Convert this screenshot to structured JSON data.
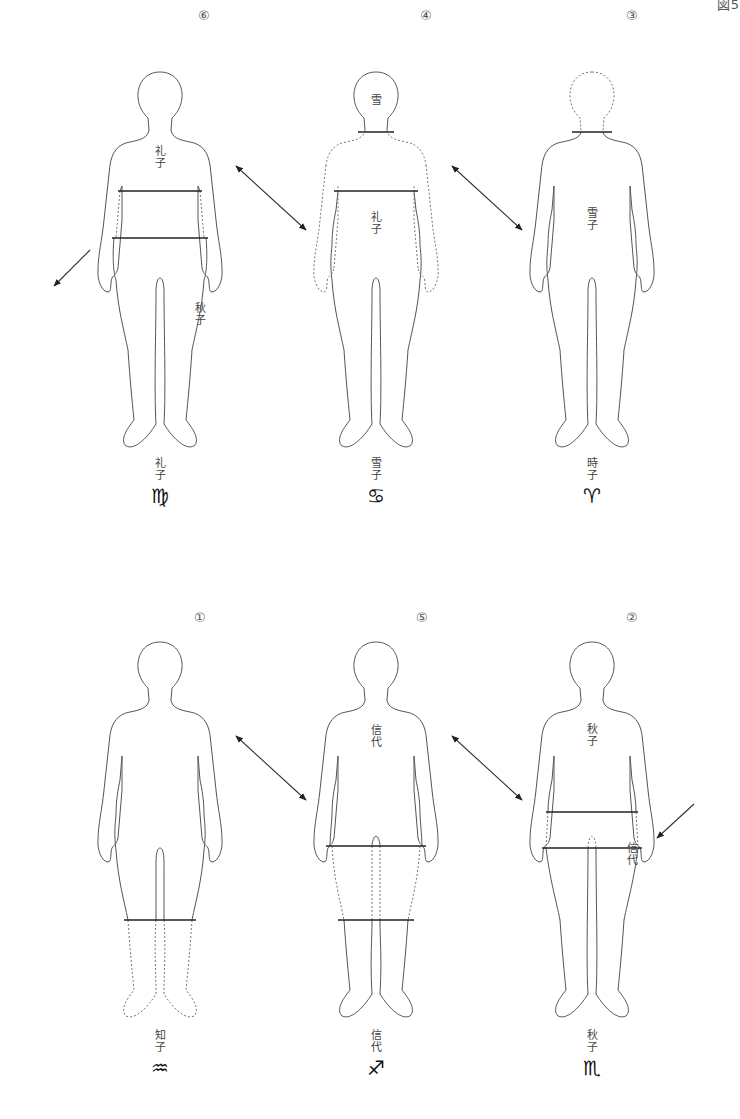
{
  "page": {
    "corner_label": "図5"
  },
  "figures": [
    {
      "id": "virgo",
      "number": "⑥",
      "name": "礼子",
      "glyph": "♍",
      "inner_labels": [
        {
          "text": "礼子",
          "pos": "chest"
        },
        {
          "text": "秋子",
          "pos": "right-leg"
        }
      ],
      "segment": "torso-lower",
      "dashed_parts": [
        "waist-sides"
      ]
    },
    {
      "id": "cancer",
      "number": "④",
      "name": "雪子",
      "glyph": "♋",
      "inner_labels": [
        {
          "text": "雪",
          "pos": "head"
        },
        {
          "text": "礼子",
          "pos": "belly"
        }
      ],
      "segment": "neck-and-waist",
      "dashed_parts": [
        "shoulders",
        "arms"
      ]
    },
    {
      "id": "aries",
      "number": "③",
      "name": "時子",
      "glyph": "♈",
      "inner_labels": [
        {
          "text": "雪子",
          "pos": "belly"
        }
      ],
      "segment": "neck",
      "dashed_parts": [
        "head"
      ]
    },
    {
      "id": "aquarius",
      "number": "①",
      "name": "知子",
      "glyph": "♒",
      "inner_labels": [],
      "segment": "knee",
      "dashed_parts": [
        "lower-legs"
      ]
    },
    {
      "id": "sagittarius",
      "number": "⑤",
      "name": "信代",
      "glyph": "♐",
      "inner_labels": [
        {
          "text": "信代",
          "pos": "chest"
        }
      ],
      "segment": "hip-and-knee",
      "dashed_parts": [
        "thighs"
      ]
    },
    {
      "id": "scorpio",
      "number": "②",
      "name": "秋子",
      "glyph": "♏",
      "inner_labels": [
        {
          "text": "秋子",
          "pos": "chest"
        },
        {
          "text": "信代",
          "pos": "right-leg"
        }
      ],
      "segment": "hip",
      "dashed_parts": [
        "hip-sides"
      ]
    }
  ],
  "arrows": [
    {
      "from": "virgo",
      "to": "outside-left",
      "type": "single"
    },
    {
      "from": "virgo",
      "to": "cancer",
      "type": "double"
    },
    {
      "from": "cancer",
      "to": "aries",
      "type": "double"
    },
    {
      "from": "aquarius",
      "to": "sagittarius",
      "type": "double"
    },
    {
      "from": "sagittarius",
      "to": "scorpio",
      "type": "double"
    },
    {
      "from": "outside-right",
      "to": "scorpio",
      "type": "single"
    }
  ]
}
